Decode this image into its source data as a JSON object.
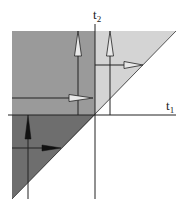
{
  "diagram": {
    "title": "",
    "axes": {
      "horizontal": {
        "base": "t",
        "subscript": "1"
      },
      "vertical": {
        "base": "t",
        "subscript": "2"
      }
    },
    "regions": [
      {
        "name": "upper-left-region",
        "shade": "medium",
        "color": "#9a9a9a",
        "description": "t1 < 0, t2 > 0"
      },
      {
        "name": "lower-left-triangle",
        "shade": "dark",
        "color": "#6e6e6e",
        "description": "t1 < 0, t2 < 0, t2 > t1"
      },
      {
        "name": "upper-right-triangle",
        "shade": "light",
        "color": "#d4d4d4",
        "description": "t1 > 0, t2 > t1"
      }
    ],
    "arrows": [
      {
        "name": "hollow-up-arrow-left",
        "direction": "up",
        "style": "hollow"
      },
      {
        "name": "hollow-right-arrow-left",
        "direction": "right",
        "style": "hollow"
      },
      {
        "name": "hollow-up-arrow-right",
        "direction": "up",
        "style": "hollow"
      },
      {
        "name": "hollow-right-arrow-right",
        "direction": "right",
        "style": "hollow"
      },
      {
        "name": "solid-up-arrow",
        "direction": "up",
        "style": "solid"
      },
      {
        "name": "solid-right-arrow",
        "direction": "right",
        "style": "solid"
      }
    ],
    "colors": {
      "line": "#222222",
      "hollow_fill": "#e8e8e8",
      "solid_fill": "#111111"
    }
  }
}
